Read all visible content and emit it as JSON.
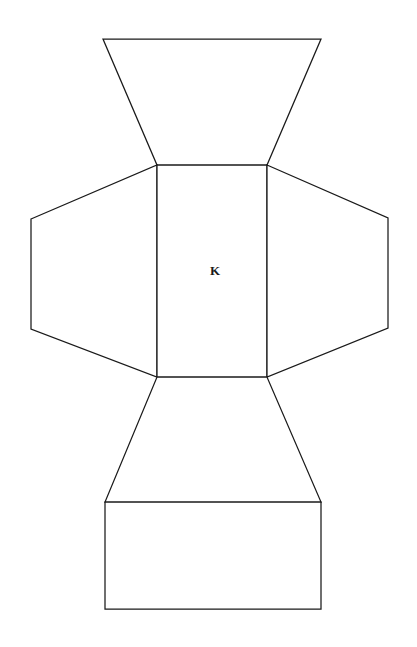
{
  "figure": {
    "background_color": "#ffffff",
    "line_color": "#1a1a1a",
    "line_width": 1.25,
    "width": 417,
    "height": 647,
    "label": "K",
    "label_position": {
      "x": 215,
      "y": 272
    },
    "faces": [
      {
        "name": "top-trapezoid-face",
        "shape": "trapezoid",
        "points": "103,39 321,39 267,165 157,165"
      },
      {
        "name": "left-trapezoid-face",
        "shape": "trapezoid",
        "points": "31,219 157,165 157,377 31,329"
      },
      {
        "name": "center-rectangle-face",
        "shape": "rectangle",
        "points": "157,165 267,165 267,377 157,377"
      },
      {
        "name": "right-trapezoid-face",
        "shape": "trapezoid",
        "points": "267,165 388,218 388,328 267,377"
      },
      {
        "name": "bottom-trapezoid-face",
        "shape": "trapezoid",
        "points": "157,377 267,377 321,502 105,502"
      },
      {
        "name": "bottom-rectangle-face",
        "shape": "rectangle",
        "points": "105,502 321,502 321,609 105,609"
      }
    ]
  }
}
